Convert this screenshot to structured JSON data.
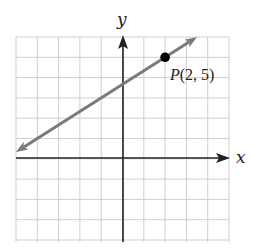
{
  "chart_data": {
    "type": "line",
    "title": "",
    "xlabel": "x",
    "ylabel": "y",
    "xlim": [
      -5,
      5
    ],
    "ylim": [
      -4,
      6
    ],
    "grid": true,
    "tick_labels": false,
    "series": [
      {
        "name": "line",
        "equation": "y = (2/3)x + 11/3",
        "slope": 0.6667,
        "y_intercept": 3.67,
        "x": [
          -5,
          3.5
        ],
        "y": [
          0.33,
          6
        ],
        "arrows": "both",
        "color": "#7a7a7a"
      }
    ],
    "points": [
      {
        "label": "P(2, 5)",
        "x": 2,
        "y": 5,
        "color": "#000000"
      }
    ],
    "annotations": [
      "P(2, 5)"
    ]
  },
  "labels": {
    "x_axis": "x",
    "y_axis": "y",
    "point": "P(2, 5)"
  },
  "colors": {
    "grid": "#cfcfcf",
    "axes": "#222222",
    "line": "#7a7a7a",
    "point": "#000000"
  }
}
